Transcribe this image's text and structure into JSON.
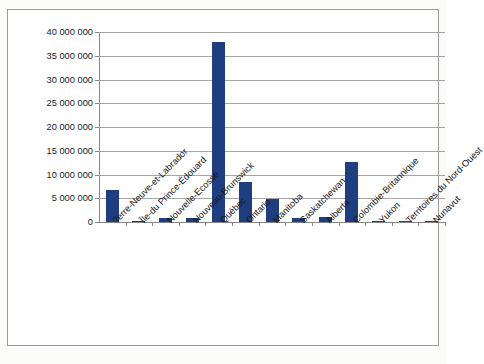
{
  "chart": {
    "title": "",
    "y_axis": {
      "min": 0,
      "max": 40000000,
      "step": 5000000,
      "tick_labels": [
        "40 000 000",
        "35 000 000",
        "30 000 000",
        "25 000 000",
        "20 000 000",
        "15 000 000",
        "10 000 000",
        "5 000 000",
        "0"
      ]
    }
  },
  "chart_data": {
    "type": "bar",
    "title": "",
    "xlabel": "",
    "ylabel": "",
    "ylim": [
      0,
      40000000
    ],
    "ytick_values": [
      0,
      5000000,
      10000000,
      15000000,
      20000000,
      25000000,
      30000000,
      35000000,
      40000000
    ],
    "ytick_labels": [
      "0",
      "5 000 000",
      "10 000 000",
      "15 000 000",
      "20 000 000",
      "25 000 000",
      "30 000 000",
      "35 000 000",
      "40 000 000"
    ],
    "grid": true,
    "legend": false,
    "bar_color": "#1f3e80",
    "categories": [
      "Terre-Neuve-et-Labrador",
      "Île-du Prince-Édouard",
      "Nouvelle-Ecosse",
      "Nouveau-Brunswick",
      "Québec",
      "Ontario",
      "Manitoba",
      "Saskatchewan",
      "Alberta",
      "Colombie-Britannique",
      "Yukon",
      "Territoires du Nord-Ouest",
      "Nunavut"
    ],
    "values": [
      6700000,
      120000,
      800000,
      900000,
      37900000,
      8400000,
      4900000,
      900000,
      1100000,
      12700000,
      60000,
      60000,
      30000
    ]
  }
}
